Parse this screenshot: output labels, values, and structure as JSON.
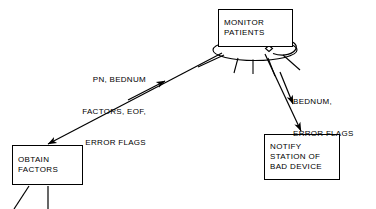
{
  "diagram": {
    "type": "flow-diagram",
    "background_color": "#ffffff",
    "stroke_color": "#000000",
    "nodes": [
      {
        "id": "monitor",
        "name": "monitor-patients-box",
        "lines": [
          "MONITOR",
          "PATIENTS"
        ],
        "x": 218,
        "y": 9,
        "width": 75,
        "height": 38
      },
      {
        "id": "obtain",
        "name": "obtain-factors-box",
        "lines": [
          "OBTAIN",
          "FACTORS"
        ],
        "x": 12,
        "y": 145,
        "width": 71,
        "height": 40
      },
      {
        "id": "notify",
        "name": "notify-station-box",
        "lines": [
          "NOTIFY",
          "STATION OF",
          "BAD DEVICE"
        ],
        "x": 264,
        "y": 134,
        "width": 76,
        "height": 46
      }
    ],
    "edge_labels": [
      {
        "id": "left_label",
        "name": "monitor-to-obtain-label",
        "lines": [
          "PN, BEDNUM",
          "FACTORS, EOF,",
          "ERROR FLAGS"
        ],
        "align": "right",
        "x": 52,
        "y": 54
      },
      {
        "id": "right_label",
        "name": "monitor-to-notify-label",
        "lines": [
          "BEDNUM,",
          "ERROR FLAGS"
        ],
        "align": "left",
        "x": 293,
        "y": 76
      }
    ],
    "edges": [
      {
        "id": "monitor_to_obtain",
        "name": "edge-monitor-to-obtain",
        "from": "monitor",
        "to": "obtain",
        "direction": "down-left",
        "arrowhead": "end"
      },
      {
        "id": "obtain_to_monitor",
        "name": "edge-obtain-to-monitor",
        "from": "obtain",
        "to": "monitor",
        "direction": "up-right",
        "arrowhead": "end"
      },
      {
        "id": "monitor_to_notify",
        "name": "edge-monitor-to-notify",
        "from": "monitor",
        "to": "notify",
        "direction": "down-right",
        "arrowhead": "end"
      },
      {
        "id": "notify_flow_short",
        "name": "edge-notify-short-arrow",
        "from": "monitor",
        "to": "notify",
        "direction": "down-right",
        "arrowhead": "end"
      }
    ],
    "decorations": [
      {
        "id": "ellipse",
        "name": "monitor-ellipse",
        "shape": "ellipse"
      },
      {
        "id": "diamond",
        "name": "ellipse-node-marker",
        "shape": "diamond"
      },
      {
        "id": "curved_arrow",
        "name": "rotation-arrow-icon",
        "shape": "curved-arrow"
      },
      {
        "id": "spokes",
        "name": "ellipse-spoke-lines",
        "shape": "radiating-lines",
        "count": 5
      },
      {
        "id": "obtain_legs",
        "name": "obtain-factors-leg-lines",
        "shape": "lines",
        "count": 2
      }
    ]
  }
}
